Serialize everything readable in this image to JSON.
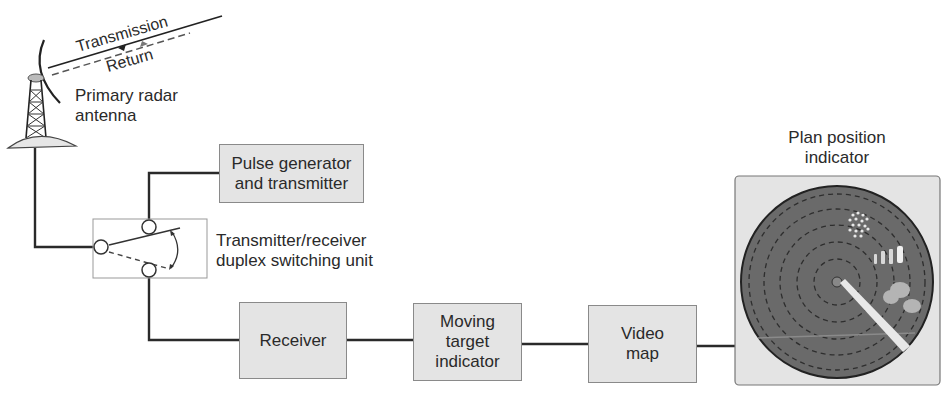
{
  "diagram": {
    "beam": {
      "transmission": "Transmission",
      "return": "Return"
    },
    "antenna": {
      "label_line1": "Primary radar",
      "label_line2": "antenna"
    },
    "pulse_generator": {
      "line1": "Pulse generator",
      "line2": "and transmitter"
    },
    "duplexer": {
      "line1": "Transmitter/receiver",
      "line2": "duplex switching unit"
    },
    "receiver": {
      "label": "Receiver"
    },
    "mti": {
      "line1": "Moving",
      "line2": "target",
      "line3": "indicator"
    },
    "video_map": {
      "line1": "Video",
      "line2": "map"
    },
    "ppi": {
      "line1": "Plan position",
      "line2": "indicator"
    },
    "colors": {
      "box_fill": "#e4e4e4",
      "box_border": "#8a8a8a",
      "wire": "#2a2a2a",
      "scope_fill": "#6a6a6a",
      "scope_ring": "#333333"
    }
  }
}
